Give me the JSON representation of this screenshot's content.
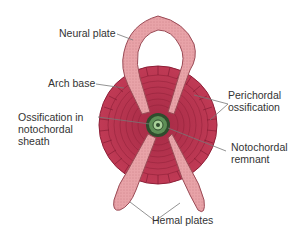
{
  "diagram": {
    "labels": {
      "neural_plate": "Neural plate",
      "arch_base": "Arch base",
      "ossification_line1": "Ossification in",
      "ossification_line2": "notochordal",
      "ossification_line3": "sheath",
      "perichordal_line1": "Perichordal",
      "perichordal_line2": "ossification",
      "notochordal_line1": "Notochordal",
      "notochordal_line2": "remnant",
      "hemal_plates": "Hemal plates"
    },
    "colors": {
      "centrum": "#b8364f",
      "centrum_dark": "#8e2038",
      "plate_fill": "#e8a3a8",
      "plate_stroke": "#9a4a55",
      "notochord": "#3b6b3a",
      "leader_line": "#777777",
      "text": "#333333"
    }
  }
}
